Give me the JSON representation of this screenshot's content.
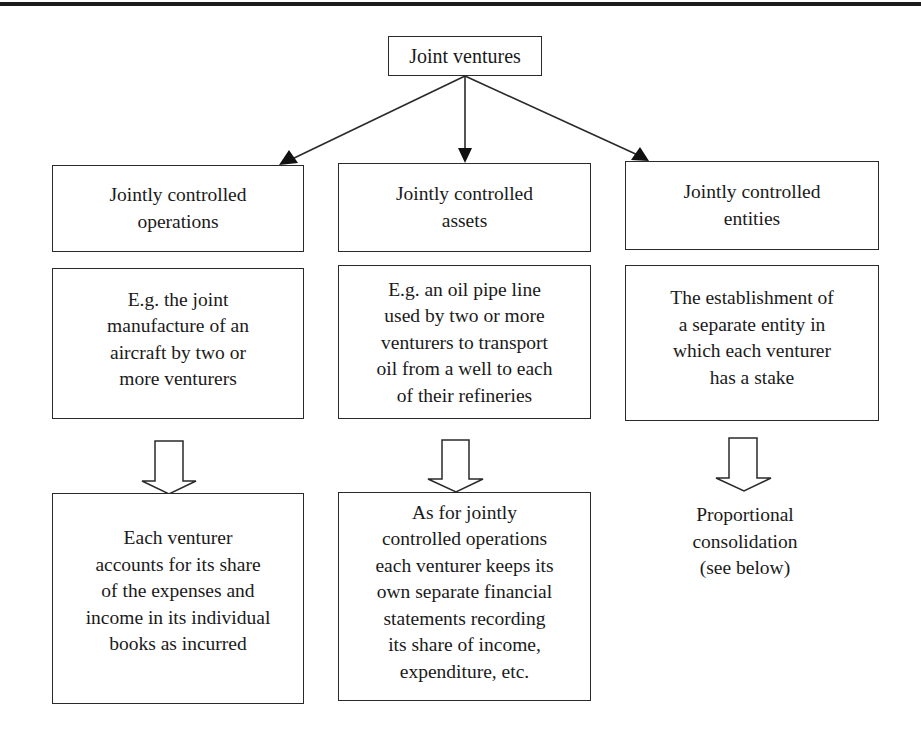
{
  "diagram": {
    "root": {
      "label": "Joint ventures"
    },
    "columns": [
      {
        "category": "Jointly controlled\noperations",
        "example": "E.g. the joint\nmanufacture of an\naircraft by two or\nmore venturers",
        "treatment": "Each venturer\naccounts for its share\nof the expenses and\nincome in its individual\nbooks as incurred",
        "treatment_boxed": true
      },
      {
        "category": "Jointly controlled\nassets",
        "example": "E.g. an oil pipe line\nused by two or more\nventurers to transport\noil from a well to each\nof their refineries",
        "treatment": "As for jointly\ncontrolled operations\neach venturer keeps its\nown separate financial\nstatements recording\nits share of income,\nexpenditure, etc.",
        "treatment_boxed": true
      },
      {
        "category": "Jointly controlled\nentities",
        "example": "The establishment of\na separate entity in\nwhich each venturer\nhas a stake",
        "treatment": "Proportional\nconsolidation\n(see below)",
        "treatment_boxed": false
      }
    ],
    "colors": {
      "line": "#2a2a2a",
      "text": "#1a1a1a",
      "background": "#ffffff"
    }
  }
}
